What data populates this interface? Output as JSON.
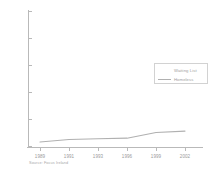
{
  "chart_data": {
    "type": "line",
    "title": "",
    "subtitle": "",
    "xlabel": "",
    "ylabel": "",
    "xlim": [
      1988,
      2003
    ],
    "ylim": [
      0,
      50000
    ],
    "grid": false,
    "legend_position": "upper right",
    "x_tick_labels": [
      "1989",
      "1991",
      "1993",
      "1996",
      "1999",
      "2002"
    ],
    "y_tick_labels": [
      "50000",
      "40000",
      "30000",
      "20000",
      "10000",
      "0"
    ],
    "y_tick_values": [
      50000,
      40000,
      30000,
      20000,
      10000,
      0
    ],
    "legend_entries": [
      {
        "label": "Waiting List",
        "swatch": "none"
      },
      {
        "label": "Homeless",
        "swatch": "line"
      }
    ],
    "series": [
      {
        "name": "Homeless",
        "color": "#b0b0b0",
        "x": [
          1989,
          1991,
          1993,
          1996,
          1999,
          2002
        ],
        "values": [
          1500,
          2400,
          2700,
          2900,
          5000,
          5500
        ]
      }
    ],
    "caption": "Source: Focus Ireland"
  },
  "axes": {
    "y_ticks": [
      {
        "label": "50000",
        "top": 11
      },
      {
        "label": "40000",
        "top": 38
      },
      {
        "label": "30000",
        "top": 65
      },
      {
        "label": "20000",
        "top": 92
      },
      {
        "label": "10000",
        "top": 119
      },
      {
        "label": "0",
        "top": 146
      }
    ],
    "x_ticks": [
      {
        "label": "1989",
        "left": 40
      },
      {
        "label": "1991",
        "left": 69
      },
      {
        "label": "1993",
        "left": 98
      },
      {
        "label": "1996",
        "left": 127
      },
      {
        "label": "1999",
        "left": 156
      },
      {
        "label": "2002",
        "left": 185
      }
    ]
  },
  "legend": {
    "rows": [
      {
        "label": "Waiting List",
        "top": 2
      },
      {
        "label": "Homeless",
        "top": 11
      }
    ]
  },
  "caption": {
    "text": "Source: Focus Ireland"
  },
  "colors": {
    "axis": "#b9b9b9",
    "tick_text": "#9a9a9a",
    "series_line": "#b0b0b0",
    "legend_border": "#d2d2d2",
    "caption_text": "#a8a8a8",
    "background": "#ffffff"
  }
}
